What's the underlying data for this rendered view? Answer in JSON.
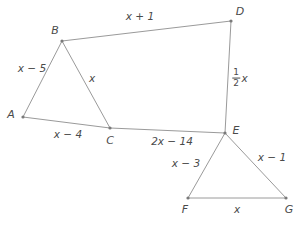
{
  "figure": {
    "type": "geometry-diagram",
    "line_color": "#9a9a9a",
    "vertex_color": "#7a7a7a",
    "text_color": "#4a4a4a",
    "background_color": "#ffffff",
    "width": 299,
    "height": 226
  },
  "vertices": [
    {
      "name": "A",
      "label": "A",
      "x": 23,
      "y": 117,
      "label_x": 11,
      "label_y": 114
    },
    {
      "name": "B",
      "label": "B",
      "x": 62,
      "y": 41,
      "label_x": 55,
      "label_y": 30
    },
    {
      "name": "C",
      "label": "C",
      "x": 110,
      "y": 128,
      "label_x": 110,
      "label_y": 140
    },
    {
      "name": "D",
      "label": "D",
      "x": 231,
      "y": 21,
      "label_x": 240,
      "label_y": 11
    },
    {
      "name": "E",
      "label": "E",
      "x": 225,
      "y": 133,
      "label_x": 236,
      "label_y": 130
    },
    {
      "name": "F",
      "label": "F",
      "x": 188,
      "y": 198,
      "label_x": 185,
      "label_y": 209
    },
    {
      "name": "G",
      "label": "G",
      "x": 286,
      "y": 198,
      "label_x": 289,
      "label_y": 209
    }
  ],
  "segments": [
    {
      "name": "segment-AB",
      "from": "A",
      "to": "B"
    },
    {
      "name": "segment-BC",
      "from": "B",
      "to": "C"
    },
    {
      "name": "segment-AC",
      "from": "A",
      "to": "C"
    },
    {
      "name": "segment-BD",
      "from": "B",
      "to": "D"
    },
    {
      "name": "segment-DE",
      "from": "D",
      "to": "E"
    },
    {
      "name": "segment-CE",
      "from": "C",
      "to": "E"
    },
    {
      "name": "segment-EF",
      "from": "E",
      "to": "F"
    },
    {
      "name": "segment-EG",
      "from": "E",
      "to": "G"
    },
    {
      "name": "segment-FG",
      "from": "F",
      "to": "G"
    }
  ],
  "edge_labels": [
    {
      "name": "label-AB",
      "segment": "AB",
      "text": "x − 5",
      "x": 32,
      "y": 68
    },
    {
      "name": "label-BC",
      "segment": "BC",
      "text": "x",
      "x": 92,
      "y": 78
    },
    {
      "name": "label-AC",
      "segment": "AC",
      "text": "x − 4",
      "x": 68,
      "y": 134
    },
    {
      "name": "label-BD",
      "segment": "BD",
      "text": "x + 1",
      "x": 140,
      "y": 16
    },
    {
      "name": "label-DE",
      "segment": "DE",
      "text": "1/2 x",
      "numerator": "1",
      "denominator": "2",
      "variable": "x",
      "x": 240,
      "y": 78,
      "is_fraction": true
    },
    {
      "name": "label-CE",
      "segment": "CE",
      "text": "2x − 14",
      "x": 172,
      "y": 141
    },
    {
      "name": "label-EF",
      "segment": "EF",
      "text": "x − 3",
      "x": 186,
      "y": 163
    },
    {
      "name": "label-EG",
      "segment": "EG",
      "text": "x − 1",
      "x": 272,
      "y": 157
    },
    {
      "name": "label-FG",
      "segment": "FG",
      "text": "x",
      "x": 237,
      "y": 209
    }
  ]
}
